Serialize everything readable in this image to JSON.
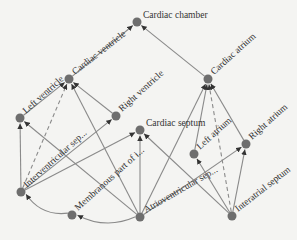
{
  "diagram": {
    "type": "knowledge-graph",
    "nodes": [
      {
        "id": "cardiac_chamber",
        "label": "Cardiac chamber",
        "x": 137,
        "y": 22,
        "angle": 0
      },
      {
        "id": "cardiac_ventricle",
        "label": "Cardiac ventricle",
        "x": 69,
        "y": 79,
        "angle": -38
      },
      {
        "id": "cardiac_atrium",
        "label": "Cardiac atrium",
        "x": 208,
        "y": 79,
        "angle": -42
      },
      {
        "id": "left_ventricle",
        "label": "Left ventricle",
        "x": 20,
        "y": 118,
        "angle": -42
      },
      {
        "id": "right_ventricle",
        "label": "Right ventricle",
        "x": 116,
        "y": 116,
        "angle": -42
      },
      {
        "id": "interventricular_sep",
        "label": "Interventricular sep...",
        "x": 21,
        "y": 192,
        "angle": -42
      },
      {
        "id": "cardiac_septum",
        "label": "Cardiac septum",
        "x": 140,
        "y": 130,
        "angle": 0
      },
      {
        "id": "left_atrium",
        "label": "Left atrium",
        "x": 194,
        "y": 154,
        "angle": -42
      },
      {
        "id": "right_atrium",
        "label": "Right atrium",
        "x": 246,
        "y": 144,
        "angle": -42
      },
      {
        "id": "membranous_part",
        "label": "Membranous part of i...",
        "x": 72,
        "y": 215,
        "angle": -42
      },
      {
        "id": "atrioventricular_sep",
        "label": "Atrioventricular sep...",
        "x": 140,
        "y": 217,
        "angle": -30
      },
      {
        "id": "interatrial_septum",
        "label": "Interatrial septum",
        "x": 232,
        "y": 216,
        "angle": -38
      }
    ],
    "edges": [
      {
        "from": "cardiac_ventricle",
        "to": "cardiac_chamber",
        "style": "solid"
      },
      {
        "from": "cardiac_atrium",
        "to": "cardiac_chamber",
        "style": "solid"
      },
      {
        "from": "left_ventricle",
        "to": "cardiac_ventricle",
        "style": "solid"
      },
      {
        "from": "right_ventricle",
        "to": "cardiac_ventricle",
        "style": "solid"
      },
      {
        "from": "interventricular_sep",
        "to": "cardiac_ventricle",
        "style": "dashed"
      },
      {
        "from": "atrioventricular_sep",
        "to": "cardiac_ventricle",
        "style": "solid"
      },
      {
        "from": "interventricular_sep",
        "to": "left_ventricle",
        "style": "solid"
      },
      {
        "from": "interventricular_sep",
        "to": "right_ventricle",
        "style": "solid"
      },
      {
        "from": "interventricular_sep",
        "to": "cardiac_septum",
        "style": "solid"
      },
      {
        "from": "atrioventricular_sep",
        "to": "left_ventricle",
        "style": "solid"
      },
      {
        "from": "membranous_part",
        "to": "interventricular_sep",
        "style": "curved"
      },
      {
        "from": "atrioventricular_sep",
        "to": "membranous_part",
        "style": "curved"
      },
      {
        "from": "atrioventricular_sep",
        "to": "cardiac_septum",
        "style": "solid"
      },
      {
        "from": "atrioventricular_sep",
        "to": "right_atrium",
        "style": "solid"
      },
      {
        "from": "interatrial_septum",
        "to": "cardiac_septum",
        "style": "solid"
      },
      {
        "from": "left_atrium",
        "to": "cardiac_atrium",
        "style": "solid"
      },
      {
        "from": "right_atrium",
        "to": "cardiac_atrium",
        "style": "solid"
      },
      {
        "from": "atrioventricular_sep",
        "to": "cardiac_atrium",
        "style": "solid"
      },
      {
        "from": "interatrial_septum",
        "to": "cardiac_atrium",
        "style": "dashed"
      },
      {
        "from": "interatrial_septum",
        "to": "left_atrium",
        "style": "solid"
      },
      {
        "from": "interatrial_septum",
        "to": "right_atrium",
        "style": "solid"
      }
    ]
  },
  "colors": {
    "background": "#f4f4f2",
    "node": "#6e6e6e",
    "edge": "#8a8a8a",
    "label": "#333333"
  }
}
